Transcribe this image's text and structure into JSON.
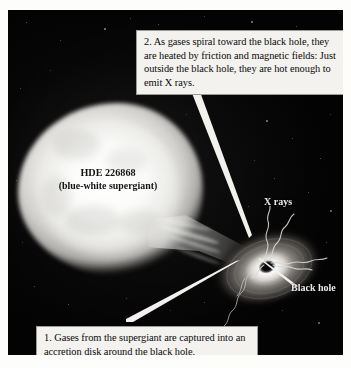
{
  "figure": {
    "type": "astronomy-illustration",
    "background_color": "#040404",
    "plate_border_color": "#fdfdfb"
  },
  "callouts": [
    {
      "id": "callout-1",
      "number": "1.",
      "text": "1. Gases from the supergiant are captured into an accretion disk around the black hole.",
      "points_to": "accretion-disk"
    },
    {
      "id": "callout-2",
      "number": "2.",
      "text": "2. As gases spiral toward the black hole, they are heated by friction and magnetic fields: Just outside the black hole, they are hot enough to emit X rays.",
      "points_to": "black-hole"
    }
  ],
  "labels": {
    "star_name": "HDE 226868",
    "star_type": "(blue-white supergiant)",
    "xrays": "X rays",
    "black_hole": "Black hole"
  },
  "objects": {
    "supergiant": "blue-white supergiant star",
    "gas_stream": "accretion stream",
    "accretion_disk": "accretion disk",
    "black_hole": "black hole",
    "xray_emission": "X ray emission"
  }
}
